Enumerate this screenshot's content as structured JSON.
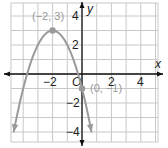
{
  "chart_data": {
    "type": "line",
    "title": "",
    "xlabel": "x",
    "ylabel": "y",
    "origin_label": "O",
    "xlim": [
      -5,
      5
    ],
    "ylim": [
      -4.7,
      4.8
    ],
    "grid": true,
    "x_ticks": [
      {
        "value": -2,
        "label": "−2"
      },
      {
        "value": 2,
        "label": "2"
      },
      {
        "value": 4,
        "label": "4"
      }
    ],
    "y_ticks": [
      {
        "value": 4,
        "label": "4"
      },
      {
        "value": 2,
        "label": "2"
      },
      {
        "value": -2,
        "label": "−2"
      },
      {
        "value": -4,
        "label": "−4"
      }
    ],
    "series": [
      {
        "name": "y = -(x + 2)^2 + 3",
        "equation": "y = -(x+2)^2 + 3",
        "color": "#9a9a9a",
        "x": [
          -4.65,
          -4,
          -3,
          -2,
          -1,
          0,
          0.65
        ],
        "y": [
          -4.0,
          -1,
          2,
          3,
          2,
          -1,
          -4.0
        ]
      }
    ],
    "annotations": [
      {
        "point": [
          -2,
          3
        ],
        "label": "(−2, 3)"
      },
      {
        "point": [
          0,
          -1
        ],
        "label": "(0, −1)"
      }
    ]
  },
  "colors": {
    "grid": "#c8c8c8",
    "axis": "#111111",
    "curve": "#9a9a9a",
    "point": "#9a9a9a",
    "point_label": "#999999"
  }
}
